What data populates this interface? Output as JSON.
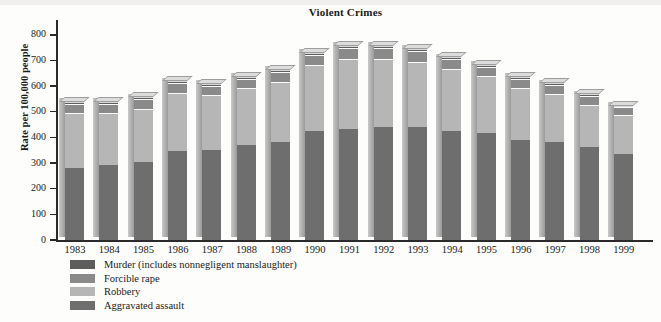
{
  "chart_data": {
    "type": "bar",
    "stacked": true,
    "title": "Violent Crimes",
    "xlabel": "",
    "ylabel": "Rate per 100,000 people",
    "ylim": [
      0,
      850
    ],
    "yticks": [
      0,
      100,
      200,
      300,
      400,
      500,
      600,
      700,
      800
    ],
    "grid": false,
    "legend_position": "below-left",
    "categories": [
      "1983",
      "1984",
      "1985",
      "1986",
      "1987",
      "1988",
      "1989",
      "1990",
      "1991",
      "1992",
      "1993",
      "1994",
      "1995",
      "1996",
      "1997",
      "1998",
      "1999"
    ],
    "series": [
      {
        "name": "Aggravated assault",
        "color": "#6e6e6e",
        "values": [
          280,
          291,
          303,
          347,
          352,
          370,
          383,
          424,
          433,
          442,
          440,
          427,
          418,
          391,
          382,
          361,
          336
        ]
      },
      {
        "name": "Robbery",
        "color": "#b6b6b6",
        "values": [
          217,
          205,
          209,
          226,
          213,
          221,
          234,
          257,
          273,
          264,
          256,
          238,
          221,
          202,
          186,
          166,
          150
        ]
      },
      {
        "name": "Forcible rape",
        "color": "#8a8a8a",
        "values": [
          34,
          36,
          37,
          38,
          37,
          38,
          38,
          41,
          42,
          43,
          41,
          39,
          37,
          36,
          36,
          35,
          32
        ]
      },
      {
        "name": "Murder (includes nonnegligent manslaughter)",
        "color": "#5d5d5d",
        "values": [
          8,
          8,
          8,
          9,
          8,
          8,
          9,
          9,
          10,
          9,
          9,
          9,
          8,
          7,
          7,
          6,
          6
        ]
      }
    ],
    "totals": [
      539,
      540,
      557,
      620,
      610,
      637,
      664,
      731,
      758,
      758,
      746,
      713,
      684,
      636,
      611,
      568,
      524
    ]
  },
  "chart": {
    "title": "Violent Crimes",
    "ylabel": "Rate per 100,000 people",
    "ytick_labels": [
      "800",
      "700",
      "600",
      "500",
      "400",
      "300",
      "200",
      "100",
      "0"
    ],
    "xtick_labels": [
      "1983",
      "1984",
      "1985",
      "1986",
      "1987",
      "1988",
      "1989",
      "1990",
      "1991",
      "1992",
      "1993",
      "1994",
      "1995",
      "1996",
      "1997",
      "1998",
      "1999"
    ],
    "legend": [
      {
        "label": "Murder (includes nonnegligent manslaughter)",
        "color": "#5d5d5d"
      },
      {
        "label": "Forcible rape",
        "color": "#8a8a8a"
      },
      {
        "label": "Robbery",
        "color": "#b6b6b6"
      },
      {
        "label": "Aggravated assault",
        "color": "#6e6e6e"
      }
    ]
  }
}
